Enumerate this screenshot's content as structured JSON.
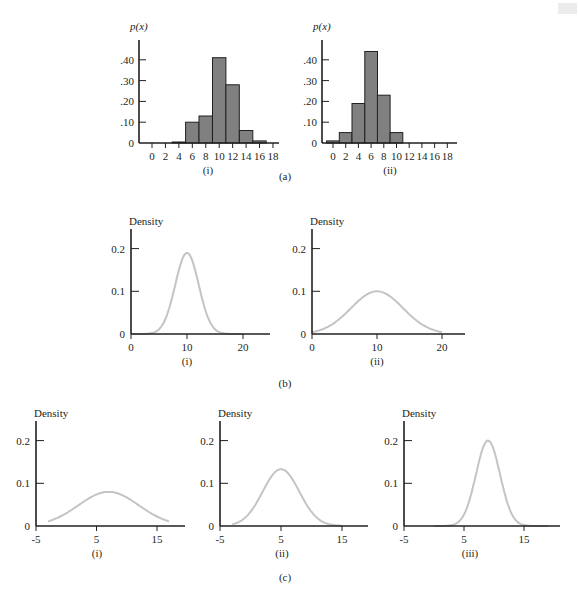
{
  "figure": {
    "section_labels": {
      "a": "(a)",
      "b": "(b)",
      "c": "(c)"
    },
    "colors": {
      "bars": "#808080",
      "curves": "#c4c4c4",
      "axes": "#231f20"
    }
  },
  "chart_data": [
    {
      "id": "a-i",
      "type": "bar",
      "panel_label": "(i)",
      "group": "(a)",
      "ylabel": "p(x)",
      "xlabel": "",
      "x_ticks": [
        "0",
        "2",
        "4",
        "6",
        "8",
        "10",
        "12",
        "14",
        "16",
        "18"
      ],
      "y_ticks": [
        "0",
        ".10",
        ".20",
        ".30",
        ".40"
      ],
      "ylim": [
        0,
        0.48
      ],
      "categories": [
        0,
        2,
        4,
        6,
        8,
        10,
        12,
        14,
        16,
        18
      ],
      "values": [
        0.0,
        0.0,
        0.005,
        0.1,
        0.13,
        0.41,
        0.28,
        0.06,
        0.01,
        0.0
      ]
    },
    {
      "id": "a-ii",
      "type": "bar",
      "panel_label": "(ii)",
      "group": "(a)",
      "ylabel": "p(x)",
      "xlabel": "",
      "x_ticks": [
        "0",
        "2",
        "4",
        "6",
        "8",
        "10",
        "12",
        "14",
        "16",
        "18"
      ],
      "y_ticks": [
        "0",
        ".10",
        ".20",
        ".30",
        ".40"
      ],
      "ylim": [
        0,
        0.48
      ],
      "categories": [
        0,
        2,
        4,
        6,
        8,
        10,
        12,
        14,
        16,
        18
      ],
      "values": [
        0.01,
        0.05,
        0.19,
        0.44,
        0.23,
        0.05,
        0.0,
        0.0,
        0.0,
        0.0
      ]
    },
    {
      "id": "b-i",
      "type": "line",
      "panel_label": "(i)",
      "group": "(b)",
      "ylabel": "Density",
      "x_ticks": [
        "0",
        "10",
        "20"
      ],
      "y_ticks": [
        "0",
        "0.1",
        "0.2"
      ],
      "xlim": [
        0,
        25
      ],
      "ylim": [
        0,
        0.25
      ],
      "distribution": {
        "shape": "normal",
        "mean": 10,
        "sd": 2.1,
        "peak": 0.19,
        "x_range": [
          0,
          20
        ]
      }
    },
    {
      "id": "b-ii",
      "type": "line",
      "panel_label": "(ii)",
      "group": "(b)",
      "ylabel": "Density",
      "x_ticks": [
        "0",
        "10",
        "20"
      ],
      "y_ticks": [
        "0",
        "0.1",
        "0.2"
      ],
      "xlim": [
        0,
        25
      ],
      "ylim": [
        0,
        0.25
      ],
      "distribution": {
        "shape": "normal",
        "mean": 10,
        "sd": 4,
        "peak": 0.1,
        "x_range": [
          0,
          20
        ]
      }
    },
    {
      "id": "c-i",
      "type": "line",
      "panel_label": "(i)",
      "group": "(c)",
      "ylabel": "Density",
      "x_ticks": [
        "-5",
        "5",
        "15"
      ],
      "y_ticks": [
        "0",
        "0.1",
        "0.2"
      ],
      "xlim": [
        -5,
        20
      ],
      "ylim": [
        0,
        0.25
      ],
      "distribution": {
        "shape": "normal",
        "mean": 7,
        "sd": 5,
        "peak": 0.08,
        "x_range": [
          -3,
          17
        ]
      }
    },
    {
      "id": "c-ii",
      "type": "line",
      "panel_label": "(ii)",
      "group": "(c)",
      "ylabel": "Density",
      "x_ticks": [
        "-5",
        "5",
        "15"
      ],
      "y_ticks": [
        "0",
        "0.1",
        "0.2"
      ],
      "xlim": [
        -5,
        20
      ],
      "ylim": [
        0,
        0.25
      ],
      "distribution": {
        "shape": "normal",
        "mean": 5,
        "sd": 3,
        "peak": 0.133,
        "x_range": [
          -3,
          15
        ]
      }
    },
    {
      "id": "c-iii",
      "type": "line",
      "panel_label": "(iii)",
      "group": "(c)",
      "ylabel": "Density",
      "x_ticks": [
        "-5",
        "5",
        "15"
      ],
      "y_ticks": [
        "0",
        "0.1",
        "0.2"
      ],
      "xlim": [
        -5,
        20
      ],
      "ylim": [
        0,
        0.25
      ],
      "distribution": {
        "shape": "normal",
        "mean": 9,
        "sd": 2,
        "peak": 0.2,
        "x_range": [
          0,
          19
        ]
      }
    }
  ]
}
